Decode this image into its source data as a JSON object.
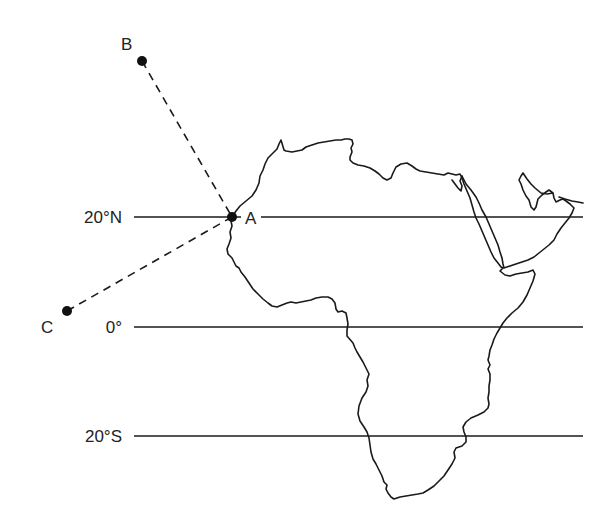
{
  "map": {
    "title": "",
    "colors": {
      "ink": "#1a1a1a",
      "background": "#ffffff"
    },
    "latitudes": [
      {
        "label": "20°N",
        "y": 217,
        "x1": 134,
        "x2": 583,
        "label_x": 122
      },
      {
        "label": "0°",
        "y": 327,
        "x1": 134,
        "x2": 583,
        "label_x": 122
      },
      {
        "label": "20°S",
        "y": 436,
        "x1": 134,
        "x2": 583,
        "label_x": 122
      }
    ],
    "points": [
      {
        "id": "A",
        "label": "A",
        "x": 232,
        "y": 217,
        "label_x": 245,
        "label_y": 224
      },
      {
        "id": "B",
        "label": "B",
        "x": 142,
        "y": 61,
        "label_x": 121,
        "label_y": 50
      },
      {
        "id": "C",
        "label": "C",
        "x": 67,
        "y": 311,
        "label_x": 41,
        "label_y": 333
      }
    ],
    "paths": [
      {
        "from": "B",
        "to": "A",
        "style": "dashed"
      },
      {
        "from": "C",
        "to": "A",
        "style": "dashed"
      }
    ],
    "landmass": "Africa and Arabian Peninsula outline"
  }
}
